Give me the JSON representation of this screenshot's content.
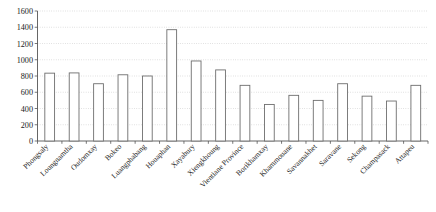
{
  "chart_data": {
    "type": "bar",
    "title": "",
    "subtitle": "",
    "xlabel": "",
    "ylabel": "",
    "ylim": [
      0,
      1600
    ],
    "ytick_step": 200,
    "yticks": [
      0,
      200,
      400,
      600,
      800,
      1000,
      1200,
      1400,
      1600
    ],
    "grid": true,
    "legend": false,
    "legend_position": "none",
    "bar_fill_color": "#ffffff",
    "bar_edge_color": "#6e6e6e",
    "grid_color": "#b9b9b9",
    "axis_color": "#555555",
    "xtick_rotation_deg": -45,
    "categories": [
      "Phongsaly",
      "Loungnamtha",
      "Oudomxay",
      "Bokeo",
      "Luangphabang",
      "Houaphan",
      "Xayabury",
      "Xiengkhoung",
      "Vientiane Province",
      "Borikhamxay",
      "Khammouane",
      "Savannakhet",
      "Saravane",
      "Sekong",
      "Champasack",
      "Attapeu"
    ],
    "values": [
      835,
      838,
      705,
      815,
      800,
      1370,
      985,
      875,
      685,
      450,
      562,
      500,
      705,
      552,
      492,
      685
    ]
  }
}
